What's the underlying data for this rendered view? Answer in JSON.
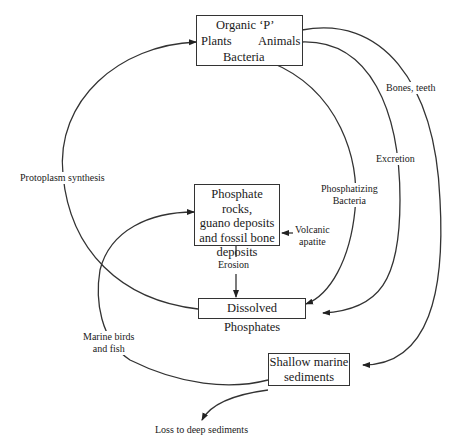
{
  "nodes": {
    "organic_p": {
      "title": "Organic ‘P’",
      "left": "Plants",
      "right": "Animals",
      "bottom": "Bacteria"
    },
    "phosphate_rocks": {
      "lines": [
        "Phosphate rocks,",
        "guano deposits",
        "and fossil bone",
        "deposits"
      ]
    },
    "dissolved": {
      "label": "Dissolved Phosphates"
    },
    "shallow": {
      "lines": [
        "Shallow marine",
        "sediments"
      ]
    }
  },
  "edges": {
    "protoplasm": "Protoplasm synthesis",
    "bones": "Bones, teeth",
    "excretion": "Excretion",
    "phosphatizing": [
      "Phosphatizing",
      "Bacteria"
    ],
    "volcanic": [
      "Volcanic",
      "apatite"
    ],
    "erosion": "Erosion",
    "marine": [
      "Marine birds",
      "and fish"
    ],
    "loss": "Loss to deep sediments"
  },
  "colors": {
    "stroke": "#333333",
    "text": "#1a1a1a"
  }
}
